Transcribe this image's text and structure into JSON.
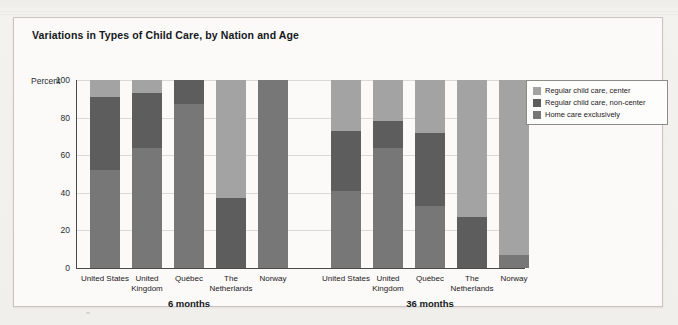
{
  "figure": {
    "title": "Variations in Types of Child Care, by Nation and Age"
  },
  "legend": {
    "items": [
      {
        "label": "Regular child care, center",
        "color": "#a3a3a3",
        "key": "center"
      },
      {
        "label": "Regular child care, non-center",
        "color": "#5d5d5d",
        "key": "noncenter"
      },
      {
        "label": "Home care exclusively",
        "color": "#777777",
        "key": "home"
      }
    ]
  },
  "axis": {
    "y_label": "Percent",
    "y_ticks": [
      "100",
      "80",
      "60",
      "40",
      "20",
      "0"
    ]
  },
  "groups": [
    {
      "label": "6 months"
    },
    {
      "label": "36 months"
    }
  ],
  "categories": [
    "United States",
    "United Kingdom",
    "Québec",
    "The Netherlands",
    "Norway"
  ],
  "chart_data": {
    "type": "bar",
    "subtype": "stacked-bar-grouped",
    "title": "Variations in Types of Child Care, by Nation and Age",
    "xlabel": "",
    "ylabel": "Percent",
    "ylim": [
      0,
      100
    ],
    "ytick_values": [
      0,
      20,
      40,
      60,
      80,
      100
    ],
    "grid": "horizontal",
    "legend_position": "right",
    "stack_order_bottom_to_top": [
      "Home care exclusively",
      "Regular child care, non-center",
      "Regular child care, center"
    ],
    "group_labels": [
      "6 months",
      "36 months"
    ],
    "categories": [
      "United States",
      "United Kingdom",
      "Québec",
      "The Netherlands",
      "Norway"
    ],
    "series": [
      {
        "name": "Home care exclusively",
        "color": "#777777",
        "values_6_months": [
          52,
          64,
          87,
          0,
          100
        ],
        "values_36_months": [
          41,
          64,
          33,
          0,
          7
        ]
      },
      {
        "name": "Regular child care, non-center",
        "color": "#5d5d5d",
        "values_6_months": [
          39,
          29,
          13,
          37,
          0
        ],
        "values_36_months": [
          32,
          14,
          39,
          27,
          0
        ]
      },
      {
        "name": "Regular child care, center",
        "color": "#a3a3a3",
        "values_6_months": [
          9,
          7,
          0,
          63,
          0
        ],
        "values_36_months": [
          27,
          22,
          28,
          73,
          93
        ]
      }
    ]
  },
  "bars": [
    {
      "group": "6 months",
      "items": [
        {
          "category": "United States",
          "home": 52,
          "noncenter": 39,
          "center": 9
        },
        {
          "category": "United Kingdom",
          "home": 64,
          "noncenter": 29,
          "center": 7
        },
        {
          "category": "Québec",
          "home": 87,
          "noncenter": 13,
          "center": 0
        },
        {
          "category": "The Netherlands",
          "home": 0,
          "noncenter": 37,
          "center": 63
        },
        {
          "category": "Norway",
          "home": 100,
          "noncenter": 0,
          "center": 0
        }
      ]
    },
    {
      "group": "36 months",
      "items": [
        {
          "category": "United States",
          "home": 41,
          "noncenter": 32,
          "center": 27
        },
        {
          "category": "United Kingdom",
          "home": 64,
          "noncenter": 14,
          "center": 22
        },
        {
          "category": "Québec",
          "home": 33,
          "noncenter": 39,
          "center": 28
        },
        {
          "category": "The Netherlands",
          "home": 0,
          "noncenter": 27,
          "center": 73
        },
        {
          "category": "Norway",
          "home": 7,
          "noncenter": 0,
          "center": 93
        }
      ]
    }
  ]
}
